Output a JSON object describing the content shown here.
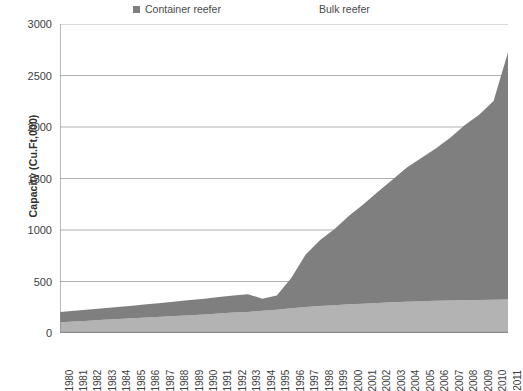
{
  "chart_data": {
    "type": "area",
    "stacked": true,
    "title": "",
    "subtitle": "",
    "xlabel": "",
    "ylabel": "Capacity (Cu.Ft,000)",
    "ylim": [
      0,
      3000
    ],
    "ytick_step": 500,
    "yticks": [
      0,
      500,
      1000,
      1500,
      2000,
      2500,
      3000
    ],
    "ytick_labels": [
      "0",
      "500",
      "1000",
      "1500",
      "2000",
      "2500",
      "3000"
    ],
    "grid": true,
    "grid_axis": "y",
    "legend_position": "top",
    "categories": [
      "1980",
      "1981",
      "1982",
      "1983",
      "1984",
      "1985",
      "1986",
      "1987",
      "1988",
      "1989",
      "1990",
      "1991",
      "1992",
      "1993",
      "1994",
      "1995",
      "1996",
      "1997",
      "1998",
      "1999",
      "2000",
      "2001",
      "2002",
      "2003",
      "2004",
      "2005",
      "2006",
      "2007",
      "2008",
      "2009",
      "2010",
      "2011"
    ],
    "series": [
      {
        "name": "Bulk reefer",
        "color": "#b3b3b3",
        "legend_swatch": "#ffffff",
        "values": [
          105,
          112,
          120,
          128,
          135,
          142,
          150,
          158,
          165,
          172,
          180,
          190,
          198,
          205,
          215,
          225,
          240,
          252,
          262,
          270,
          278,
          285,
          292,
          298,
          303,
          308,
          312,
          315,
          318,
          320,
          322,
          325
        ]
      },
      {
        "name": "Container reefer",
        "color": "#7f7f7f",
        "legend_swatch": "#7f7f7f",
        "values": [
          100,
          103,
          107,
          112,
          118,
          122,
          128,
          134,
          140,
          148,
          152,
          160,
          166,
          172,
          118,
          140,
          295,
          510,
          640,
          740,
          860,
          965,
          1080,
          1190,
          1305,
          1390,
          1480,
          1580,
          1700,
          1800,
          1930,
          2400
        ]
      }
    ],
    "series_totals": [
      205,
      215,
      227,
      240,
      253,
      264,
      278,
      292,
      305,
      320,
      332,
      350,
      364,
      377,
      333,
      365,
      535,
      762,
      902,
      1010,
      1138,
      1250,
      1372,
      1488,
      1608,
      1698,
      1792,
      1895,
      2018,
      2120,
      2252,
      2725
    ]
  },
  "legend": {
    "entries": [
      {
        "label": "Container reefer",
        "swatch": "dark"
      },
      {
        "label": "Bulk reefer",
        "swatch": "light"
      }
    ],
    "container_label": "Container reefer",
    "bulk_label": "Bulk reefer"
  },
  "axes": {
    "y_title": "Capacity (Cu.Ft,000)"
  },
  "colors": {
    "container_reefer": "#7f7f7f",
    "bulk_reefer": "#b3b3b3",
    "grid": "#a8a8a8",
    "axis": "#8a8a8a",
    "text": "#3a3a3a",
    "background": "#ffffff"
  }
}
